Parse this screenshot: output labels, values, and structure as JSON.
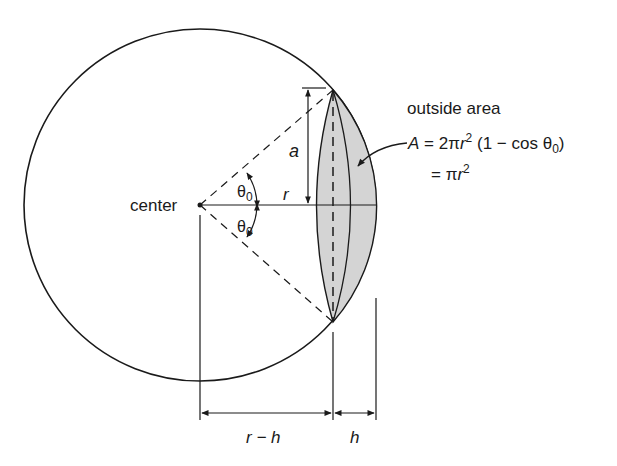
{
  "diagram": {
    "labels": {
      "center": "center",
      "a": "a",
      "r": "r",
      "theta_top": "θ",
      "theta_top_sub": "0",
      "theta_bottom": "θ",
      "theta_bottom_sub": "0",
      "r_minus_h": "r − h",
      "h": "h"
    },
    "annotation": {
      "title": "outside area",
      "eq1_A": "A",
      "eq1_rest_a": " = 2π",
      "eq1_r": "r",
      "eq1_sup": "2",
      "eq1_rest_b": " (1 − cos θ",
      "eq1_sub": "0",
      "eq1_close": ")",
      "eq2_rest": "= π",
      "eq2_r": "r",
      "eq2_sup": "2"
    },
    "colors": {
      "stroke": "#1a1a1a",
      "shade": "#d4d4d4",
      "background": "#ffffff"
    }
  }
}
